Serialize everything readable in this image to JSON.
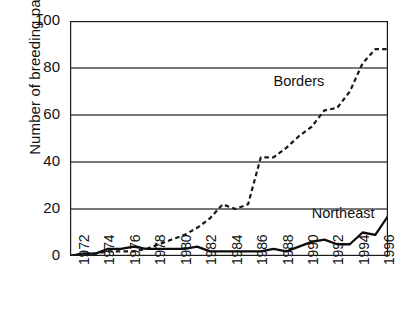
{
  "chart_data": {
    "type": "line",
    "title": "",
    "xlabel": "",
    "ylabel": "Number of breeding pairs",
    "ylim": [
      0,
      100
    ],
    "yticks": [
      0,
      20,
      40,
      60,
      80,
      100
    ],
    "ytick_labels": [
      "0",
      "20",
      "40",
      "60",
      "80",
      "100"
    ],
    "grid": "horizontal",
    "legend": "inline-annotations",
    "x": [
      1972,
      1973,
      1974,
      1975,
      1976,
      1977,
      1978,
      1979,
      1980,
      1981,
      1982,
      1983,
      1984,
      1985,
      1986,
      1987,
      1988,
      1989,
      1990,
      1991,
      1992,
      1993,
      1994,
      1995,
      1996,
      1997
    ],
    "xtick_labels": [
      "1972",
      "",
      "1974",
      "",
      "1976",
      "",
      "1978",
      "",
      "1980",
      "",
      "1982",
      "",
      "1984",
      "",
      "1986",
      "",
      "1988",
      "",
      "1990",
      "",
      "1992",
      "",
      "1994",
      "",
      "1996",
      ""
    ],
    "xlim": [
      1972,
      1997
    ],
    "series": [
      {
        "name": "Borders",
        "style": "dashed",
        "color": "#1a1a1a",
        "values": [
          0,
          1,
          1,
          2,
          2,
          2,
          3,
          5,
          7,
          9,
          12,
          16,
          22,
          20,
          22,
          42,
          42,
          46,
          51,
          55,
          62,
          63,
          70,
          82,
          88,
          88
        ]
      },
      {
        "name": "Northeast",
        "style": "solid",
        "color": "#0d0d0d",
        "values": [
          0,
          1,
          1,
          3,
          3,
          4,
          3,
          3,
          3,
          3,
          4,
          2,
          2,
          2,
          2,
          2,
          3,
          2,
          4,
          6,
          7,
          5,
          5,
          10,
          9,
          17
        ]
      }
    ],
    "annotations": [
      {
        "text": "Borders",
        "x": 1988,
        "y": 74
      },
      {
        "text": "Northeast",
        "x": 1991,
        "y": 18
      }
    ]
  }
}
